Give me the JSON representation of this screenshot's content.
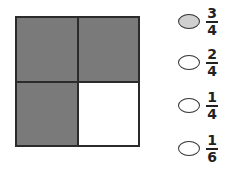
{
  "grid": {
    "rows": 2,
    "cols": 2,
    "cells": [
      {
        "shaded": true,
        "color": "#7a7a7a"
      },
      {
        "shaded": true,
        "color": "#7a7a7a"
      },
      {
        "shaded": true,
        "color": "#7a7a7a"
      },
      {
        "shaded": false,
        "color": "#ffffff"
      }
    ]
  },
  "options": [
    {
      "numerator": "3",
      "denominator": "4",
      "selected": true,
      "fill": "#d0d0d0"
    },
    {
      "numerator": "2",
      "denominator": "4",
      "selected": false,
      "fill": "#ffffff"
    },
    {
      "numerator": "1",
      "denominator": "4",
      "selected": false,
      "fill": "#ffffff"
    },
    {
      "numerator": "1",
      "denominator": "6",
      "selected": false,
      "fill": "#ffffff"
    }
  ]
}
